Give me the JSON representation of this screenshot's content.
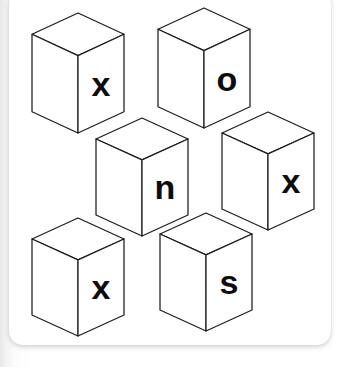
{
  "scene": {
    "title": "Cube letter puzzle",
    "background_color": "#ffffff",
    "card_color": "#ffffff",
    "cube_fill": "#ffffff",
    "cube_stroke": "#1d1d1d",
    "letter_color": "#0d0d0d",
    "cube_count": 6,
    "letters_sequence": "x o n x x s"
  },
  "caption": {
    "text": ""
  },
  "cubes": [
    {
      "id": "cube-1",
      "letter": "x",
      "row": "top",
      "column": "left",
      "x": 32,
      "y": 13,
      "width": 92,
      "height": 120,
      "font_size": 34
    },
    {
      "id": "cube-2",
      "letter": "o",
      "row": "top",
      "column": "right",
      "x": 158,
      "y": 8,
      "width": 92,
      "height": 120,
      "font_size": 34
    },
    {
      "id": "cube-3",
      "letter": "n",
      "row": "middle",
      "column": "left",
      "x": 96,
      "y": 118,
      "width": 92,
      "height": 118,
      "font_size": 34
    },
    {
      "id": "cube-4",
      "letter": "x",
      "row": "middle",
      "column": "right",
      "x": 222,
      "y": 112,
      "width": 92,
      "height": 118,
      "font_size": 34
    },
    {
      "id": "cube-5",
      "letter": "x",
      "row": "bottom",
      "column": "left",
      "x": 32,
      "y": 218,
      "width": 92,
      "height": 118,
      "font_size": 34
    },
    {
      "id": "cube-6",
      "letter": "s",
      "row": "bottom",
      "column": "right",
      "x": 160,
      "y": 213,
      "width": 92,
      "height": 118,
      "font_size": 34
    }
  ]
}
